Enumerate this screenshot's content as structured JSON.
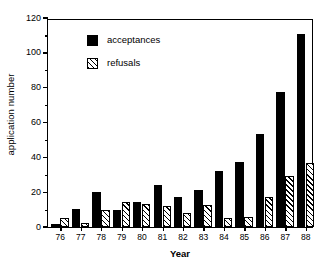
{
  "chart_data": {
    "type": "bar",
    "title": "",
    "xlabel": "Year",
    "ylabel": "application number",
    "categories": [
      "76",
      "77",
      "78",
      "79",
      "80",
      "81",
      "82",
      "83",
      "84",
      "85",
      "86",
      "87",
      "88"
    ],
    "series": [
      {
        "name": "acceptances",
        "color": "#000000",
        "fill": "solid",
        "values": [
          2,
          10.5,
          20,
          9.5,
          14.5,
          24,
          17.5,
          21.5,
          32,
          37.5,
          53.5,
          77.5,
          111
        ]
      },
      {
        "name": "refusals",
        "color": "#000000",
        "fill": "hatched",
        "values": [
          5,
          2.5,
          10,
          14.5,
          13,
          12,
          8,
          12.5,
          5,
          5.5,
          17,
          29.5,
          37
        ]
      }
    ],
    "ylim": [
      0,
      120
    ],
    "yticks": [
      0,
      20,
      40,
      60,
      80,
      100,
      120
    ],
    "yticklabels": [
      "0",
      "20",
      "40",
      "60",
      "80",
      "100",
      "120"
    ],
    "yminor": [
      10,
      30,
      50,
      70,
      90,
      110
    ],
    "grid": false,
    "legend_position": "upper-left-inside",
    "frame": true
  },
  "legend": {
    "items": [
      {
        "label": "acceptances"
      },
      {
        "label": "refusals"
      }
    ]
  }
}
